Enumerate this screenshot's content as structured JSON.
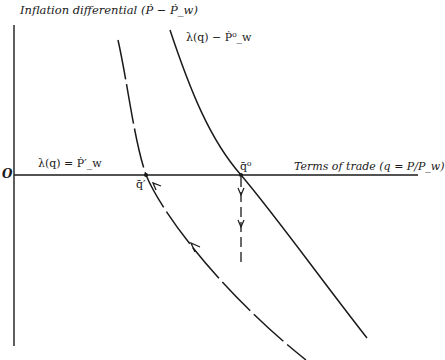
{
  "diagram": {
    "y_axis_label": "Inflation differential (Ṗ − Ṗ_w)",
    "x_axis_label": "Terms of trade (q = P/P_w)",
    "origin_label": "O",
    "curves": [
      {
        "name": "upper",
        "label": "λ(q) − Ṗ⁰_w",
        "style": "solid"
      },
      {
        "name": "lower",
        "label": "λ(q) = Ṗ′_w",
        "style": "dashed"
      }
    ],
    "points": [
      {
        "name": "q-prime",
        "label": "q̄′"
      },
      {
        "name": "q-zero",
        "label": "q̄⁰"
      }
    ],
    "colors": {
      "line": "#1a1a1a",
      "background": "#ffffff"
    }
  }
}
